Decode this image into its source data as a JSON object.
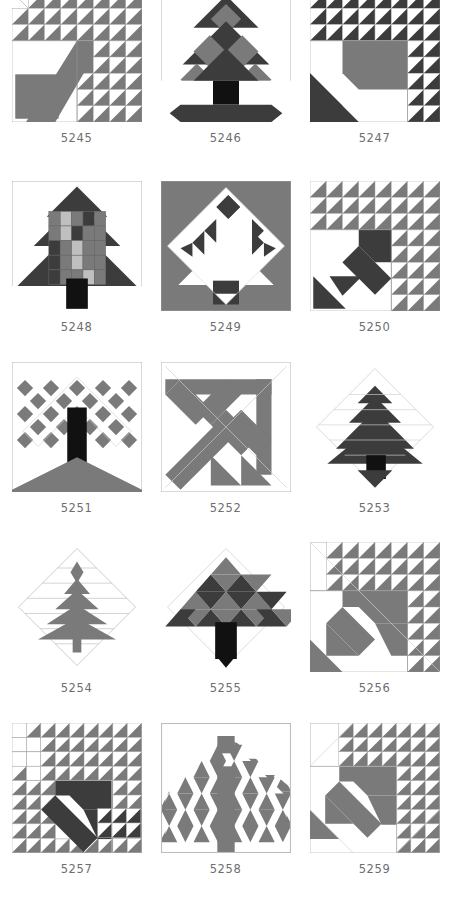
{
  "page": {
    "type": "pattern-plate",
    "columns": 3,
    "rows": 5,
    "background": "#ffffff"
  },
  "palette": {
    "white": "#ffffff",
    "light_gray": "#bfbfbf",
    "medium_gray": "#7a7a7a",
    "dark_gray": "#3c3c3c",
    "black": "#111111",
    "outline": "#9a9a9a",
    "caption_color": "#6e6e6e"
  },
  "blocks": [
    {
      "id": "5245",
      "caption": "5245",
      "name": "tree-block-5245",
      "style": "half-square-triangle-field-with-diagonal-band"
    },
    {
      "id": "5246",
      "caption": "5246",
      "name": "tree-block-5246",
      "style": "diamond-layer-tree-with-trunk-and-base"
    },
    {
      "id": "5247",
      "caption": "5247",
      "name": "tree-block-5247",
      "style": "triangle-field-with-gray-canopy-and-dark-corner"
    },
    {
      "id": "5248",
      "caption": "5248",
      "name": "tree-block-5248",
      "style": "scrappy-patchwork-tree"
    },
    {
      "id": "5249",
      "caption": "5249",
      "name": "tree-block-5249",
      "style": "on-point-diamond-tree-gray-ground"
    },
    {
      "id": "5250",
      "caption": "5250",
      "name": "tree-block-5250",
      "style": "triangle-field-with-dark-zigzag-trunk"
    },
    {
      "id": "5251",
      "caption": "5251",
      "name": "tree-block-5251",
      "style": "checkerboard-canopy-black-trunk"
    },
    {
      "id": "5252",
      "caption": "5252",
      "name": "tree-block-5252",
      "style": "angular-gray-chevron-lattice"
    },
    {
      "id": "5253",
      "caption": "5253",
      "name": "tree-block-5253",
      "style": "layered-dark-tree-on-diamond"
    },
    {
      "id": "5254",
      "caption": "5254",
      "name": "tree-block-5254",
      "style": "slender-gray-tiered-tree-on-diamond"
    },
    {
      "id": "5255",
      "caption": "5255",
      "name": "tree-block-5255",
      "style": "triangle-mosaic-tree-black-trunk"
    },
    {
      "id": "5256",
      "caption": "5256",
      "name": "tree-block-5256",
      "style": "triangle-field-with-gray-arrow"
    },
    {
      "id": "5257",
      "caption": "5257",
      "name": "tree-block-5257",
      "style": "dense-triangle-field-dark-chevron"
    },
    {
      "id": "5258",
      "caption": "5258",
      "name": "tree-block-5258",
      "style": "gable-lattice-tree-gray"
    },
    {
      "id": "5259",
      "caption": "5259",
      "name": "tree-block-5259",
      "style": "triangle-field-gray-arrow-open-corner"
    }
  ]
}
